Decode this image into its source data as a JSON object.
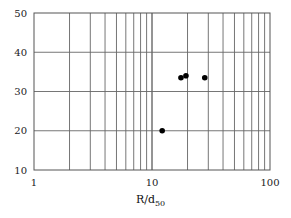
{
  "chart_data": {
    "type": "scatter",
    "title": "",
    "xlabel": "R/d",
    "xlabel_subscript": "50",
    "ylabel": "",
    "x_scale": "log",
    "xlim": [
      1,
      100
    ],
    "ylim": [
      10,
      50
    ],
    "x_ticks": [
      "1",
      "10",
      "100"
    ],
    "y_ticks": [
      "10",
      "20",
      "30",
      "40",
      "50"
    ],
    "grid": true,
    "legend": null,
    "series": [
      {
        "name": "data",
        "x": [
          12.2,
          17.6,
          19.4,
          28.0
        ],
        "y": [
          20.0,
          33.5,
          34.0,
          33.5
        ],
        "marker": "filled-circle",
        "color": "#000000"
      }
    ]
  }
}
